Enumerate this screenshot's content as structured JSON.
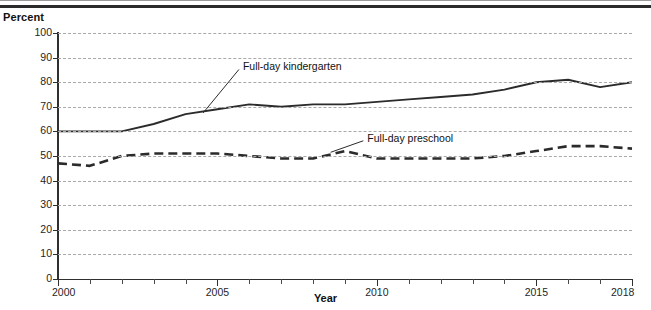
{
  "figure": {
    "y_axis_title": "Percent",
    "x_axis_title": "Year"
  },
  "chart_data": {
    "type": "line",
    "title": "",
    "subtitle": "",
    "xlabel": "Year",
    "ylabel": "Percent",
    "xlim": [
      2000,
      2018
    ],
    "ylim": [
      0,
      100
    ],
    "grid": "horizontal-dashed",
    "legend_position": "inline-annotations",
    "x": [
      2000,
      2001,
      2002,
      2003,
      2004,
      2005,
      2006,
      2007,
      2008,
      2009,
      2010,
      2011,
      2012,
      2013,
      2014,
      2015,
      2016,
      2017,
      2018
    ],
    "xticks": [
      2000,
      2005,
      2010,
      2015,
      2018
    ],
    "xtick_labels": [
      "2000",
      "2005",
      "2010",
      "2015",
      "2018"
    ],
    "yticks": [
      0,
      10,
      20,
      30,
      40,
      50,
      60,
      70,
      80,
      90,
      100
    ],
    "ytick_labels": [
      "0",
      "10",
      "20",
      "30",
      "40",
      "50",
      "60",
      "70",
      "80",
      "90",
      "100"
    ],
    "series": [
      {
        "name": "Full-day kindergarten",
        "style": "solid",
        "color": "#2b2b2b",
        "values": [
          60,
          60,
          60,
          63,
          67,
          69,
          71,
          70,
          71,
          71,
          72,
          73,
          74,
          75,
          77,
          80,
          81,
          78,
          80
        ]
      },
      {
        "name": "Full-day preschool",
        "style": "dashed",
        "color": "#2b2b2b",
        "values": [
          47,
          46,
          50,
          51,
          51,
          51,
          50,
          49,
          49,
          52,
          49,
          49,
          49,
          49,
          50,
          52,
          54,
          54,
          53
        ]
      }
    ],
    "annotations": [
      {
        "text": "Full-day kindergarten",
        "x": 2005.8,
        "y": 86
      },
      {
        "text": "Full-day preschool",
        "x": 2009.7,
        "y": 57
      }
    ]
  }
}
